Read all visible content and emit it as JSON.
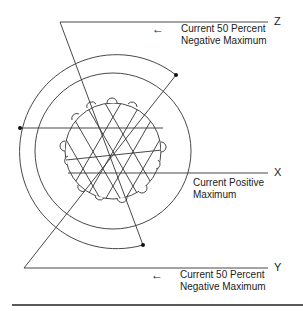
{
  "figure": {
    "type": "rotor magnetic field diagram",
    "axes": {
      "z": {
        "label": "Z",
        "caption_line1": "Current 50 Percent",
        "caption_line2": "Negative Maximum",
        "has_arrow": true
      },
      "x": {
        "label": "X",
        "caption_line1": "Current Positive",
        "caption_line2": "Maximum",
        "has_arrow": false
      },
      "y": {
        "label": "Y",
        "caption_line1": "Current 50 Percent",
        "caption_line2": "Negative Maximum",
        "has_arrow": true
      }
    },
    "arrow_glyph": "←",
    "colors": {
      "line": "#333333",
      "text": "#222222",
      "background": "#ffffff"
    }
  }
}
